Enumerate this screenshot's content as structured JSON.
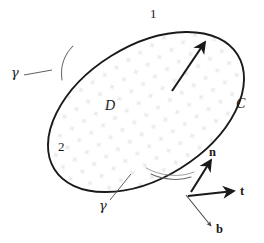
{
  "figure": {
    "type": "vector-diagram",
    "background_color": "#ffffff",
    "ink_color": "#1a1a1a",
    "stipple_color": "#d8d8d8",
    "thin_line_color": "#555555",
    "labels": {
      "side_one": "1",
      "side_two": "2",
      "region": "D",
      "boundary_curve": "C",
      "gamma_upper": "γ",
      "gamma_lower": "γ",
      "normal": "n",
      "tangent": "t",
      "binormal": "b"
    },
    "annotations": {
      "region_label_meaning": "D",
      "curve_label_meaning": "C",
      "normal_arrow": "n",
      "tangent_arrow": "t",
      "binormal_arrow": "b",
      "surface_normal_arrow": "outward normal through surface"
    },
    "geometry": {
      "ellipse_center_x": 146,
      "ellipse_center_y": 112,
      "ellipse_rx": 108,
      "ellipse_ry": 66,
      "ellipse_rotation_deg": -32,
      "tangent_point_x": 198,
      "tangent_point_y": 190
    }
  }
}
